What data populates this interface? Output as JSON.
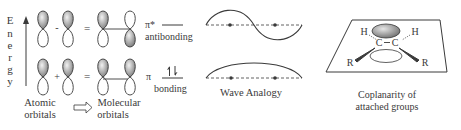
{
  "energy_axis": {
    "label_letters": [
      "E",
      "n",
      "e",
      "r",
      "g",
      "y"
    ]
  },
  "orbitals": {
    "antibonding_operator": "-",
    "bonding_operator": "+",
    "equals": "="
  },
  "energy_levels": {
    "antibonding_symbol": "π*",
    "antibonding_label": "antibonding",
    "bonding_symbol": "π",
    "bonding_label": "bonding",
    "bonding_electrons": "↑↓"
  },
  "captions": {
    "atomic_line1": "Atomic",
    "atomic_line2": "orbitals",
    "molecular_line1": "Molecular",
    "molecular_line2": "orbitals",
    "wave_analogy": "Wave Analogy",
    "coplanarity_line1": "Coplanarity of",
    "coplanarity_line2": "attached groups"
  },
  "molecule": {
    "h_left": "H",
    "h_right": "H",
    "c_left": "C",
    "c_right": "C",
    "r_left": "R",
    "r_right": "R"
  },
  "colors": {
    "stroke": "#3a3a3a",
    "shade_light": "#e8e8e8",
    "shade_dark": "#7a7a7a"
  }
}
